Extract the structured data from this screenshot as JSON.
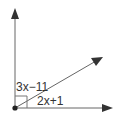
{
  "diagram": {
    "type": "angle-diagram",
    "labels": {
      "upper_angle": "3x−11",
      "lower_angle": "2x+1"
    },
    "right_angle_marker": true,
    "rays": [
      "vertical-up",
      "diagonal",
      "horizontal-right"
    ],
    "colors": {
      "stroke": "#555555",
      "arrow": "#333333",
      "vertex": "#222222"
    }
  }
}
